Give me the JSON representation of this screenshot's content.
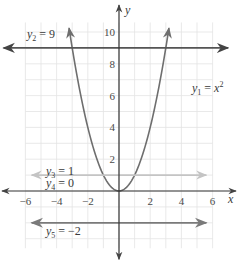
{
  "chart_data": {
    "type": "line",
    "title": "",
    "xlabel": "x",
    "ylabel": "y",
    "xlim": [
      -7,
      7
    ],
    "ylim": [
      -4,
      11
    ],
    "grid": true,
    "x_ticks": [
      -6,
      -4,
      -2,
      2,
      4,
      6
    ],
    "y_ticks": [
      2,
      4,
      6,
      8,
      10
    ],
    "x_tick_labels": [
      "−6",
      "−4",
      "−2",
      "2",
      "4",
      "6"
    ],
    "y_tick_labels": [
      "2",
      "4",
      "6",
      "8",
      "10"
    ],
    "series": [
      {
        "name": "y1 = x^2",
        "label_main": "y",
        "label_sub": "1",
        "label_rhs": " = x",
        "label_sup": "2",
        "kind": "parabola",
        "function": "x^2",
        "x_range": [
          -3.2,
          3.2
        ],
        "color": "#6e6e6e"
      },
      {
        "name": "y2 = 9",
        "label_main": "y",
        "label_sub": "2",
        "label_rhs": " = 9",
        "kind": "horizontal",
        "value": 9,
        "color": "#555555"
      },
      {
        "name": "y3 = 1",
        "label_main": "y",
        "label_sub": "3",
        "label_rhs": " = 1",
        "kind": "horizontal",
        "value": 1,
        "color": "#c4c4c4"
      },
      {
        "name": "y4 = 0",
        "label_main": "y",
        "label_sub": "4",
        "label_rhs": " = 0",
        "kind": "horizontal",
        "value": 0,
        "color": "#444444"
      },
      {
        "name": "y5 = −2",
        "label_main": "y",
        "label_sub": "5",
        "label_rhs": " = −2",
        "kind": "horizontal",
        "value": -2,
        "color": "#7a7a7a"
      }
    ]
  }
}
